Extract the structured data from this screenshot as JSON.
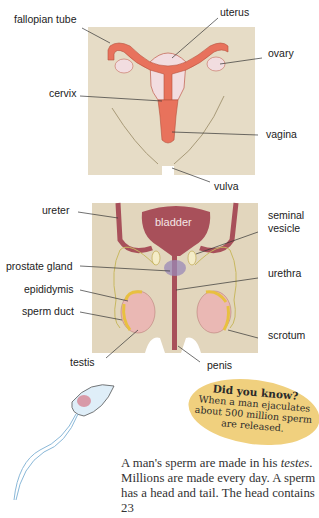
{
  "female_diagram": {
    "labels": {
      "fallopian_tube": "fallopian tube",
      "uterus": "uterus",
      "ovary": "ovary",
      "cervix": "cervix",
      "vagina": "vagina",
      "vulva": "vulva"
    },
    "colors": {
      "panel": "#e6dcc6",
      "organ": "#e8725c",
      "light": "#f2dde0"
    }
  },
  "male_diagram": {
    "labels": {
      "ureter": "ureter",
      "bladder": "bladder",
      "seminal_vesicle_1": "seminal",
      "seminal_vesicle_2": "vesicle",
      "prostate_gland": "prostate gland",
      "urethra": "urethra",
      "epididymis": "epididymis",
      "sperm_duct": "sperm duct",
      "scrotum": "scrotum",
      "testis": "testis",
      "penis": "penis"
    },
    "colors": {
      "panel": "#e2d6bd",
      "bladder": "#a8505a",
      "testis": "#eab8b4",
      "epididymis": "#e8c040"
    }
  },
  "did_you_know": {
    "title": "Did you know?",
    "line1": "When a man ejaculates",
    "line2": "about 500 million sperm",
    "line3": "are released."
  },
  "body_text": {
    "part1": "A man's sperm are made in his ",
    "italic": "testes",
    "part2": ". Millions are made every day. A sperm has a head and tail. The head contains 23"
  }
}
